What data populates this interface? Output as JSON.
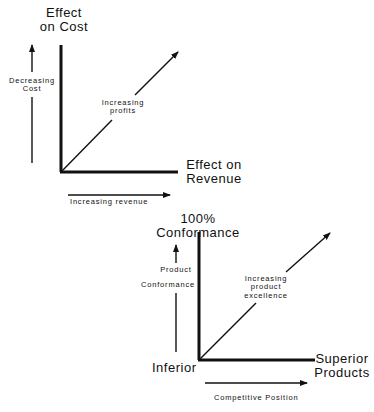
{
  "diagram_top": {
    "y_axis_title_line1": "Effect",
    "y_axis_title_line2": "on Cost",
    "x_axis_title_line1": "Effect on",
    "x_axis_title_line2": "Revenue",
    "left_arrow_label_line1": "Decreasing",
    "left_arrow_label_line2": "Cost",
    "diagonal_label_line1": "Increasing",
    "diagonal_label_line2": "profits",
    "bottom_arrow_label": "Increasing revenue"
  },
  "diagram_bottom": {
    "y_axis_title_line1": "100%",
    "y_axis_title_line2": "Conformance",
    "x_axis_title_line1": "Superior",
    "x_axis_title_line2": "Products",
    "origin_label": "Inferior",
    "left_arrow_label_line1": "Product",
    "left_arrow_label_line2": "Conformance",
    "diagonal_label_line1": "Increasing",
    "diagonal_label_line2": "product",
    "diagonal_label_line3": "excellence",
    "bottom_arrow_label": "Competitive Position"
  },
  "colors": {
    "ink": "#111111",
    "background": "#ffffff"
  }
}
